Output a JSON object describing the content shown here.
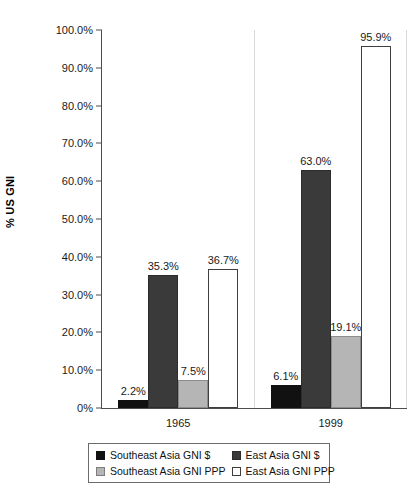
{
  "chart_data": {
    "type": "bar",
    "title": "",
    "xlabel": "",
    "ylabel": "% US GNI",
    "ylim": [
      0,
      100
    ],
    "ytick_labels": [
      "100.0%",
      "90.0%",
      "80.0%",
      "70.0%",
      "60.0%",
      "50.0%",
      "40.0%",
      "30.0%",
      "20.0%",
      "10.0%",
      "0%"
    ],
    "ytick_values": [
      100,
      90,
      80,
      70,
      60,
      50,
      40,
      30,
      20,
      10,
      0
    ],
    "categories": [
      "1965",
      "1999"
    ],
    "grid": false,
    "legend_position": "bottom",
    "series": [
      {
        "name": "Southeast Asia GNI $",
        "style": "s-black",
        "values": [
          2.2,
          6.1
        ],
        "labels": [
          "2.2%",
          "6.1%"
        ]
      },
      {
        "name": "East Asia GNI $",
        "style": "s-dark",
        "values": [
          35.3,
          63.0
        ],
        "labels": [
          "35.3%",
          "63.0%"
        ]
      },
      {
        "name": "Southeast Asia GNI PPP",
        "style": "s-light",
        "values": [
          7.5,
          19.1
        ],
        "labels": [
          "7.5%",
          "19.1%"
        ]
      },
      {
        "name": "East Asia GNI PPP",
        "style": "s-white",
        "values": [
          36.7,
          95.9
        ],
        "labels": [
          "36.7%",
          "95.9%"
        ]
      }
    ]
  }
}
